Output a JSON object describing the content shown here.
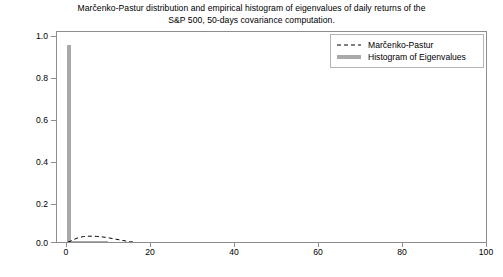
{
  "chart_data": {
    "type": "bar",
    "title": "Marčenko-Pastur distribution and empirical histogram of eigenvalues of daily returns of the\nS&P 500, 50-days covariance computation.",
    "xlabel": "",
    "ylabel": "",
    "xlim": [
      -2.5,
      103
    ],
    "ylim": [
      0.0,
      1.05
    ],
    "grid": false,
    "legend_position": "upper right",
    "xticks": [
      0,
      20,
      40,
      60,
      80,
      100
    ],
    "xtick_labels": [
      "0",
      "20",
      "40",
      "60",
      "80",
      "100"
    ],
    "yticks": [
      0.0,
      0.2,
      0.4,
      0.6,
      0.8,
      1.0
    ],
    "ytick_labels": [
      "0.0",
      "0.2",
      "0.4",
      "0.6",
      "0.8",
      "1.0"
    ],
    "series": [
      {
        "name": "Histogram of Eigenvalues",
        "type": "bar",
        "color": "#a9a9a9",
        "linestyle": "solid",
        "bin_width": 1.0,
        "x": [
          0.5,
          1.5,
          2.5,
          3.5,
          4.5,
          5.5,
          6.5,
          7.5,
          8.5,
          9.5,
          10.5,
          11.5,
          12.5,
          13.5,
          14.5,
          15.5
        ],
        "values": [
          0.978,
          0.004,
          0.003,
          0.002,
          0.002,
          0.001,
          0.001,
          0.001,
          0.001,
          0.001,
          0.0,
          0.0,
          0.0,
          0.0,
          0.0,
          0.0
        ]
      },
      {
        "name": "Marčenko-Pastur",
        "type": "line",
        "color": "#000000",
        "linestyle": "dashed",
        "x": [
          0.2,
          0.8,
          1.6,
          2.4,
          3.2,
          4.0,
          4.8,
          5.6,
          6.4,
          7.2,
          8.0,
          8.8,
          9.6,
          10.4,
          11.2,
          12.0,
          12.8,
          13.6,
          14.4,
          15.0,
          15.6,
          16.2
        ],
        "values": [
          0.0,
          0.004,
          0.012,
          0.019,
          0.024,
          0.027,
          0.029,
          0.029,
          0.029,
          0.028,
          0.027,
          0.025,
          0.023,
          0.02,
          0.017,
          0.014,
          0.011,
          0.008,
          0.005,
          0.003,
          0.001,
          0.0
        ]
      }
    ]
  },
  "legend": {
    "entries": [
      {
        "label": "Marčenko-Pastur",
        "marker": "dashed-line",
        "color": "#000000"
      },
      {
        "label": "Histogram of Eigenvalues",
        "marker": "thick-solid-line",
        "color": "#a9a9a9"
      }
    ]
  },
  "colors": {
    "histogram": "#a9a9a9",
    "marcenko_pastur": "#000000",
    "axis": "#8d8d8d",
    "background": "#ffffff"
  }
}
